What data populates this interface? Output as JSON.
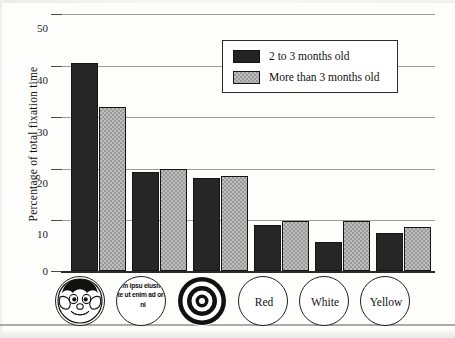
{
  "chart_data": {
    "type": "bar",
    "title": "",
    "xlabel": "",
    "ylabel": "Percentage of total fixation time",
    "ylim": [
      0,
      50
    ],
    "yticks": [
      0,
      10,
      20,
      30,
      40,
      50
    ],
    "ytick_labels": [
      "0",
      "10",
      "20",
      "30",
      "40",
      "50"
    ],
    "grid": true,
    "legend_position": "top-right",
    "categories": [
      "Face",
      "Newsprint",
      "Bullseye",
      "Red",
      "White",
      "Yellow"
    ],
    "category_labels": [
      "",
      "",
      "",
      "Red",
      "White",
      "Yellow"
    ],
    "category_icons": [
      "face-icon",
      "newsprint-icon",
      "bullseye-icon",
      "red-circle",
      "white-circle",
      "yellow-circle"
    ],
    "series": [
      {
        "name": "2 to 3 months old",
        "color": "#262626",
        "values": [
          40.5,
          19.3,
          18.0,
          9.0,
          5.7,
          7.3
        ]
      },
      {
        "name": "More than 3 months old",
        "color": "#bdbdbd",
        "values": [
          32.0,
          19.8,
          18.4,
          9.8,
          9.8,
          8.6
        ]
      }
    ]
  },
  "legend": {
    "items": [
      {
        "label": "2 to 3 months old",
        "swatch": "dark"
      },
      {
        "label": "More than 3 months old",
        "swatch": "light"
      }
    ]
  },
  "axis": {
    "y_title": "Percentage of total fixation time",
    "y_labels": [
      "50",
      "40",
      "30",
      "20",
      "10",
      "0"
    ]
  },
  "newsprint_text": "rem ipsu eiusmod te ut enim ad oris ni"
}
